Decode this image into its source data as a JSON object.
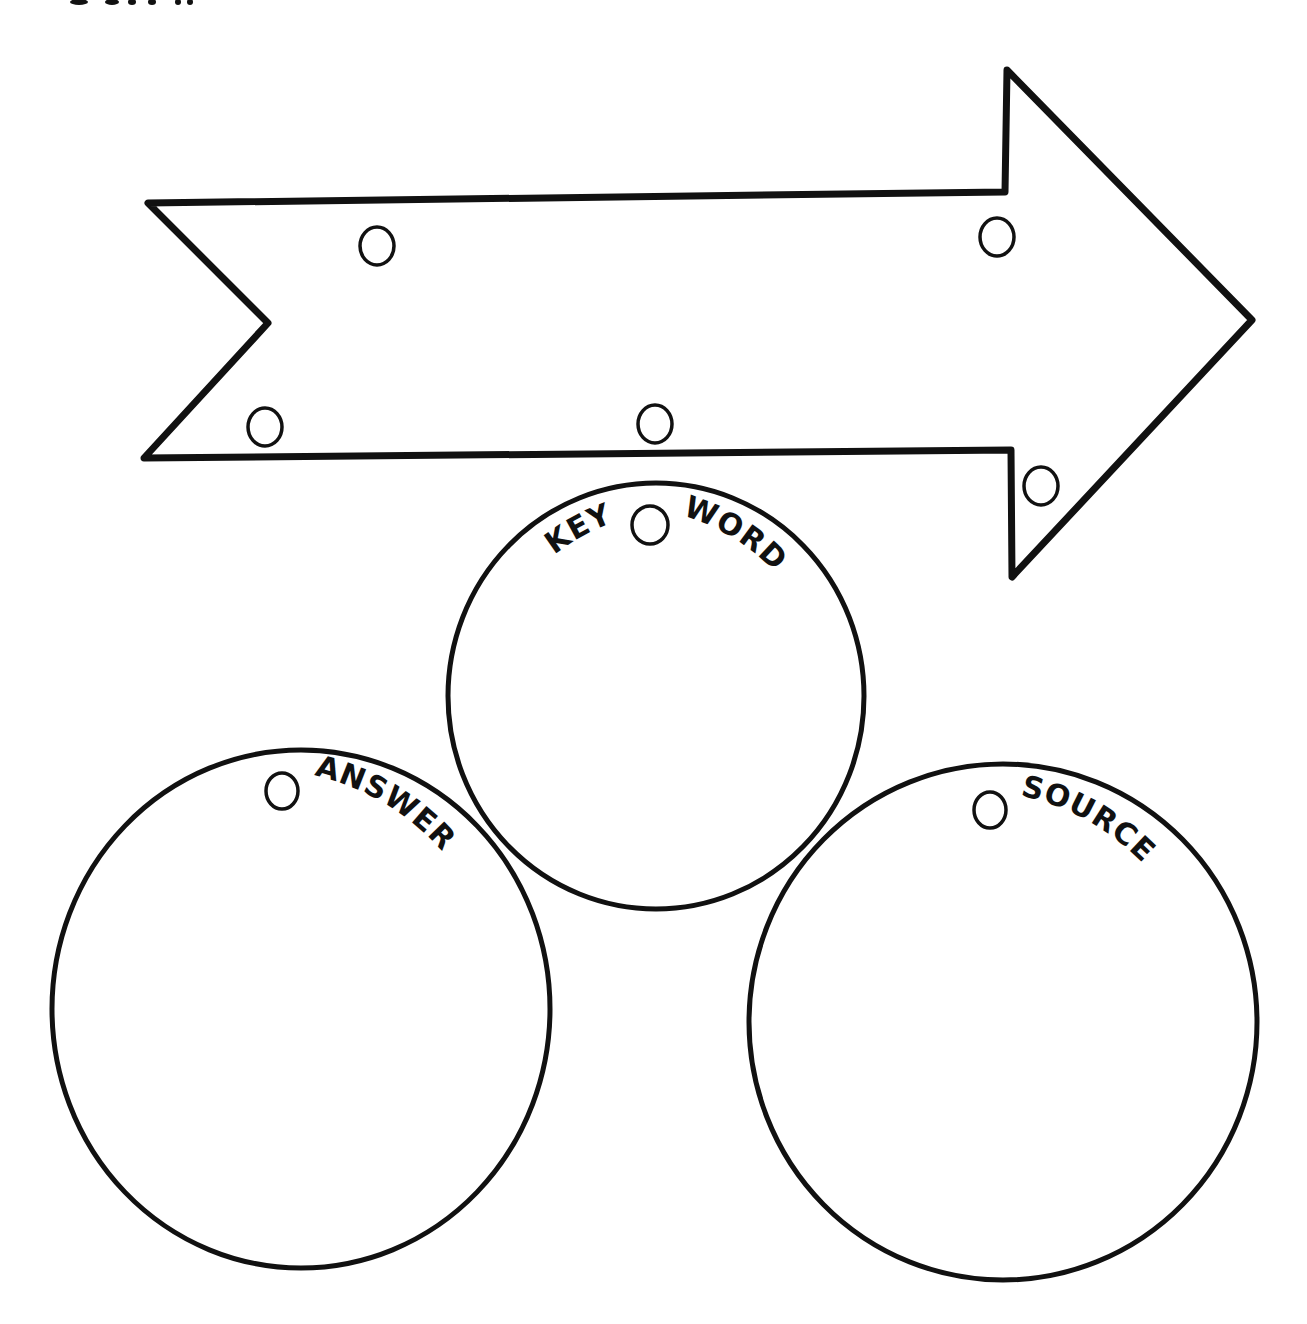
{
  "page": {
    "background": "#ffffff",
    "ink_color": "#111111",
    "cutoff_marks_top": [
      {
        "x": 70,
        "w": 18
      },
      {
        "x": 105,
        "w": 14
      },
      {
        "x": 128,
        "w": 10
      },
      {
        "x": 148,
        "w": 10
      },
      {
        "x": 175,
        "w": 10
      },
      {
        "x": 185,
        "w": 10
      }
    ]
  },
  "arrow": {
    "shape": "chevron-tailed right arrow",
    "checkboxes": [
      {
        "id": "arrow-check-1",
        "cx": 377,
        "cy": 246
      },
      {
        "id": "arrow-check-2",
        "cx": 997,
        "cy": 237
      },
      {
        "id": "arrow-check-3",
        "cx": 265,
        "cy": 427
      },
      {
        "id": "arrow-check-4",
        "cx": 655,
        "cy": 424
      },
      {
        "id": "arrow-check-5",
        "cx": 1041,
        "cy": 486
      }
    ]
  },
  "circles": {
    "keyword": {
      "label_left": "KEY",
      "label_right": "WORD",
      "cx": 656,
      "cy": 696,
      "rx": 208,
      "ry": 213
    },
    "answer": {
      "label": "ANSWER",
      "cx": 301,
      "cy": 1009,
      "rx": 249,
      "ry": 259
    },
    "source": {
      "label": "SOURCE",
      "cx": 1003,
      "cy": 1022,
      "rx": 254,
      "ry": 258
    }
  }
}
